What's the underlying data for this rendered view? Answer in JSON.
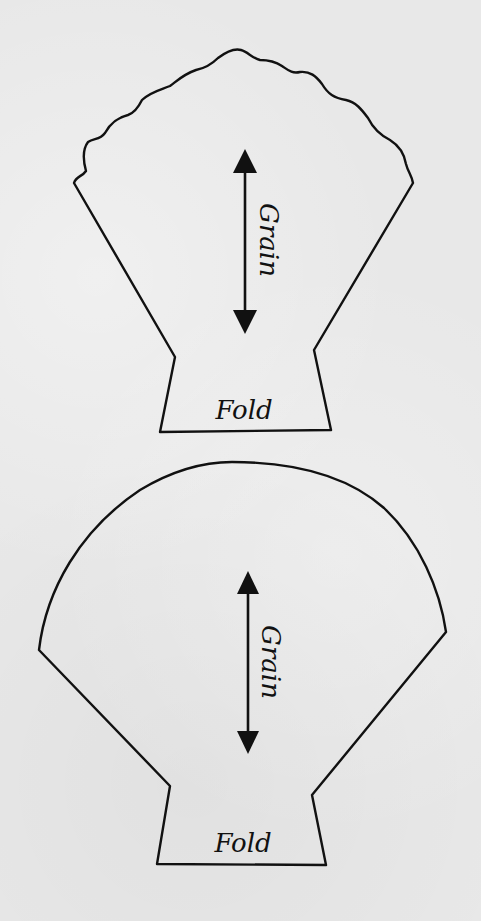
{
  "colors": {
    "background": "#e8e8e8",
    "line": "#111111"
  },
  "patterns": [
    {
      "id": "scalloped-shell",
      "grain_label": "Grain",
      "fold_label": "Fold",
      "grain_arrow": {
        "x": 245,
        "y_top": 150,
        "y_bottom": 333
      },
      "grain_label_pos": {
        "x": 268,
        "y": 240
      },
      "fold_label_pos": {
        "x": 244,
        "y": 410
      }
    },
    {
      "id": "round-shell",
      "grain_label": "Grain",
      "fold_label": "Fold",
      "grain_arrow": {
        "x": 248,
        "y_top": 572,
        "y_bottom": 753
      },
      "grain_label_pos": {
        "x": 270,
        "y": 662
      },
      "fold_label_pos": {
        "x": 243,
        "y": 843
      }
    }
  ]
}
